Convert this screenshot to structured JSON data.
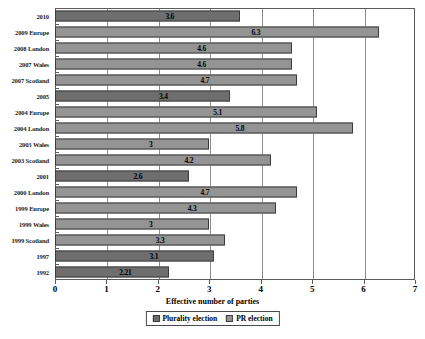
{
  "chart_data": {
    "type": "bar",
    "orientation": "horizontal",
    "title": "",
    "xlabel": "Effective number of parties",
    "ylabel": "",
    "xlim": [
      0,
      7
    ],
    "xticks": [
      0,
      1,
      2,
      3,
      4,
      5,
      6,
      7
    ],
    "grid": true,
    "legend_position": "bottom",
    "categories": [
      "2010",
      "2009 Europe",
      "2008 London",
      "2007 Wales",
      "2007 Scotland",
      "2005",
      "2004 Europe",
      "2004 London",
      "2003 Wales",
      "2003 Scotland",
      "2001",
      "2000 London",
      "1999 Europe",
      "1999 Wales",
      "1999 Scotland",
      "1997",
      "1992"
    ],
    "values": [
      3.6,
      6.3,
      4.6,
      4.6,
      4.7,
      3.4,
      5.1,
      5.8,
      3,
      4.2,
      2.6,
      4.7,
      4.3,
      3,
      3.3,
      3.1,
      2.21
    ],
    "value_labels": [
      "3.6",
      "6.3",
      "4.6",
      "4.6",
      "4.7",
      "3.4",
      "5.1",
      "5.8",
      "3",
      "4.2",
      "2.6",
      "4.7",
      "4.3",
      "3",
      "3.3",
      "3.1",
      "2.21"
    ],
    "series_of_bar": [
      "plurality",
      "pr",
      "pr",
      "pr",
      "pr",
      "plurality",
      "pr",
      "pr",
      "pr",
      "pr",
      "plurality",
      "pr",
      "pr",
      "pr",
      "pr",
      "plurality",
      "plurality"
    ],
    "series": [
      {
        "name": "Plurality election",
        "color": "#6e6e6e"
      },
      {
        "name": "PR election",
        "color": "#949494"
      }
    ]
  },
  "legend": {
    "plurality_label": "Plurality election",
    "pr_label": "PR election"
  },
  "colors": {
    "plurality": "#6e6e6e",
    "pr": "#949494",
    "axis": "#5a5a5a",
    "grid": "#8e8e8e",
    "text": "#000000"
  }
}
